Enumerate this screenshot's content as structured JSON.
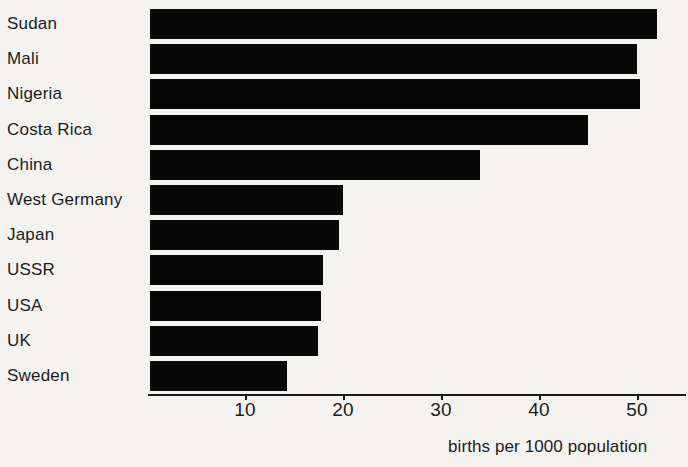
{
  "chart_data": {
    "type": "bar",
    "orientation": "horizontal",
    "title": "",
    "subtitle": "",
    "xlabel": "births per 1000 population",
    "ylabel": "",
    "categories": [
      "Sudan",
      "Mali",
      "Nigeria",
      "Costa Rica",
      "China",
      "West Germany",
      "Japan",
      "USSR",
      "USA",
      "UK",
      "Sweden"
    ],
    "values": [
      52,
      50,
      50.3,
      45,
      34,
      20,
      19.6,
      18,
      17.8,
      17.4,
      14.3
    ],
    "xlim": [
      0,
      55
    ],
    "xticks": [
      10,
      20,
      30,
      40,
      50
    ],
    "xtick_labels": [
      "10",
      "20",
      "30",
      "40",
      "50"
    ],
    "grid": false,
    "legend": null,
    "bar_color": "#080808",
    "background_color": "#f4f3f0",
    "axis_color": "#1a1a1a"
  },
  "axis": {
    "title": "births per 1000 population"
  }
}
